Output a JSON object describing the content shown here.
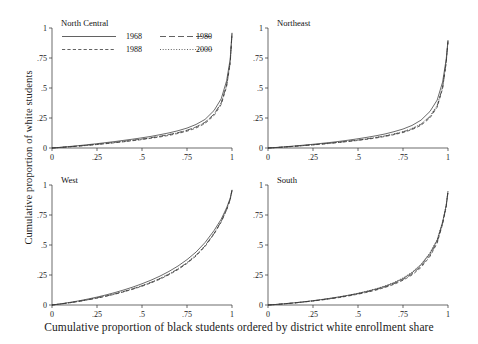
{
  "figure": {
    "xlabel": "Cumulative proportion of black students ordered by district white enrollment share",
    "ylabel": "Cumulative proportion of white students"
  },
  "chart_data": {
    "type": "line",
    "title": "",
    "xlabel": "Cumulative proportion of black students ordered by district white enrollment share",
    "ylabel": "Cumulative proportion of white students",
    "xlim": [
      0,
      1
    ],
    "ylim": [
      0,
      1
    ],
    "xticks": [
      0,
      0.25,
      0.5,
      0.75,
      1
    ],
    "xticklabels": [
      "0",
      ".25",
      ".5",
      ".75",
      "1"
    ],
    "yticks": [
      0,
      0.25,
      0.5,
      0.75,
      1
    ],
    "yticklabels": [
      "0",
      ".25",
      ".5",
      ".75",
      "1"
    ],
    "grid": false,
    "legend_position": "top-left-of-first-panel",
    "legend": [
      {
        "name": "1968",
        "dash": "none"
      },
      {
        "name": "1980",
        "dash": "long"
      },
      {
        "name": "1988",
        "dash": "short"
      },
      {
        "name": "2000",
        "dash": "dotted"
      }
    ],
    "panels": [
      {
        "name": "North Central",
        "series": [
          {
            "name": "1968",
            "dash": "none",
            "x": [
              0,
              0.05,
              0.1,
              0.15,
              0.2,
              0.25,
              0.3,
              0.35,
              0.4,
              0.45,
              0.5,
              0.55,
              0.6,
              0.65,
              0.7,
              0.75,
              0.8,
              0.85,
              0.9,
              0.94,
              0.97,
              0.99,
              1.0
            ],
            "y": [
              0,
              0.006,
              0.013,
              0.02,
              0.028,
              0.036,
              0.045,
              0.054,
              0.064,
              0.074,
              0.085,
              0.097,
              0.111,
              0.126,
              0.144,
              0.166,
              0.196,
              0.238,
              0.312,
              0.41,
              0.56,
              0.74,
              0.96
            ]
          },
          {
            "name": "1980",
            "dash": "long",
            "x": [
              0,
              0.05,
              0.1,
              0.15,
              0.2,
              0.25,
              0.3,
              0.35,
              0.4,
              0.45,
              0.5,
              0.55,
              0.6,
              0.65,
              0.7,
              0.75,
              0.8,
              0.85,
              0.9,
              0.94,
              0.97,
              0.99,
              1.0
            ],
            "y": [
              0,
              0.005,
              0.011,
              0.017,
              0.024,
              0.031,
              0.039,
              0.047,
              0.056,
              0.065,
              0.075,
              0.086,
              0.098,
              0.112,
              0.128,
              0.148,
              0.175,
              0.214,
              0.282,
              0.375,
              0.525,
              0.715,
              0.955
            ]
          },
          {
            "name": "1988",
            "dash": "short",
            "x": [
              0,
              0.05,
              0.1,
              0.15,
              0.2,
              0.25,
              0.3,
              0.35,
              0.4,
              0.45,
              0.5,
              0.55,
              0.6,
              0.65,
              0.7,
              0.75,
              0.8,
              0.85,
              0.9,
              0.94,
              0.97,
              0.99,
              1.0
            ],
            "y": [
              0,
              0.005,
              0.01,
              0.016,
              0.022,
              0.029,
              0.036,
              0.044,
              0.052,
              0.061,
              0.07,
              0.081,
              0.092,
              0.105,
              0.121,
              0.14,
              0.166,
              0.204,
              0.27,
              0.362,
              0.512,
              0.705,
              0.95
            ]
          },
          {
            "name": "2000",
            "dash": "dotted",
            "x": [
              0,
              0.05,
              0.1,
              0.15,
              0.2,
              0.25,
              0.3,
              0.35,
              0.4,
              0.45,
              0.5,
              0.55,
              0.6,
              0.65,
              0.7,
              0.75,
              0.8,
              0.85,
              0.9,
              0.94,
              0.97,
              0.99,
              1.0
            ],
            "y": [
              0,
              0.005,
              0.011,
              0.017,
              0.023,
              0.03,
              0.038,
              0.046,
              0.055,
              0.064,
              0.074,
              0.085,
              0.097,
              0.111,
              0.127,
              0.147,
              0.174,
              0.212,
              0.28,
              0.372,
              0.522,
              0.712,
              0.953
            ]
          }
        ]
      },
      {
        "name": "Northeast",
        "series": [
          {
            "name": "1968",
            "dash": "none",
            "x": [
              0,
              0.05,
              0.1,
              0.15,
              0.2,
              0.25,
              0.3,
              0.35,
              0.4,
              0.45,
              0.5,
              0.55,
              0.6,
              0.65,
              0.7,
              0.75,
              0.8,
              0.85,
              0.9,
              0.94,
              0.97,
              0.99,
              1.0
            ],
            "y": [
              0,
              0.005,
              0.011,
              0.017,
              0.024,
              0.031,
              0.039,
              0.047,
              0.056,
              0.066,
              0.077,
              0.089,
              0.102,
              0.117,
              0.136,
              0.158,
              0.188,
              0.232,
              0.305,
              0.4,
              0.55,
              0.74,
              0.9
            ]
          },
          {
            "name": "1980",
            "dash": "long",
            "x": [
              0,
              0.05,
              0.1,
              0.15,
              0.2,
              0.25,
              0.3,
              0.35,
              0.4,
              0.45,
              0.5,
              0.55,
              0.6,
              0.65,
              0.7,
              0.75,
              0.8,
              0.85,
              0.9,
              0.94,
              0.97,
              0.99,
              1.0
            ],
            "y": [
              0,
              0.004,
              0.009,
              0.015,
              0.021,
              0.027,
              0.034,
              0.041,
              0.049,
              0.057,
              0.066,
              0.076,
              0.087,
              0.1,
              0.115,
              0.134,
              0.159,
              0.196,
              0.26,
              0.35,
              0.505,
              0.715,
              0.89
            ]
          },
          {
            "name": "1988",
            "dash": "short",
            "x": [
              0,
              0.05,
              0.1,
              0.15,
              0.2,
              0.25,
              0.3,
              0.35,
              0.4,
              0.45,
              0.5,
              0.55,
              0.6,
              0.65,
              0.7,
              0.75,
              0.8,
              0.85,
              0.9,
              0.94,
              0.97,
              0.99,
              1.0
            ],
            "y": [
              0,
              0.004,
              0.009,
              0.014,
              0.02,
              0.026,
              0.032,
              0.039,
              0.047,
              0.055,
              0.063,
              0.073,
              0.083,
              0.096,
              0.111,
              0.129,
              0.153,
              0.189,
              0.251,
              0.34,
              0.496,
              0.71,
              0.885
            ]
          },
          {
            "name": "2000",
            "dash": "dotted",
            "x": [
              0,
              0.05,
              0.1,
              0.15,
              0.2,
              0.25,
              0.3,
              0.35,
              0.4,
              0.45,
              0.5,
              0.55,
              0.6,
              0.65,
              0.7,
              0.75,
              0.8,
              0.85,
              0.9,
              0.94,
              0.97,
              0.99,
              1.0
            ],
            "y": [
              0,
              0.004,
              0.009,
              0.015,
              0.021,
              0.027,
              0.034,
              0.041,
              0.049,
              0.058,
              0.067,
              0.077,
              0.089,
              0.102,
              0.118,
              0.137,
              0.163,
              0.201,
              0.266,
              0.356,
              0.51,
              0.718,
              0.892
            ]
          }
        ]
      },
      {
        "name": "West",
        "series": [
          {
            "name": "1968",
            "dash": "none",
            "x": [
              0,
              0.05,
              0.1,
              0.15,
              0.2,
              0.25,
              0.3,
              0.35,
              0.4,
              0.45,
              0.5,
              0.55,
              0.6,
              0.65,
              0.7,
              0.75,
              0.8,
              0.85,
              0.9,
              0.94,
              0.97,
              0.99,
              1.0
            ],
            "y": [
              0,
              0.01,
              0.022,
              0.035,
              0.05,
              0.066,
              0.084,
              0.104,
              0.126,
              0.15,
              0.177,
              0.207,
              0.241,
              0.28,
              0.325,
              0.378,
              0.441,
              0.52,
              0.62,
              0.715,
              0.81,
              0.89,
              0.96
            ]
          },
          {
            "name": "1980",
            "dash": "long",
            "x": [
              0,
              0.05,
              0.1,
              0.15,
              0.2,
              0.25,
              0.3,
              0.35,
              0.4,
              0.45,
              0.5,
              0.55,
              0.6,
              0.65,
              0.7,
              0.75,
              0.8,
              0.85,
              0.9,
              0.94,
              0.97,
              0.99,
              1.0
            ],
            "y": [
              0,
              0.009,
              0.019,
              0.031,
              0.044,
              0.059,
              0.075,
              0.093,
              0.113,
              0.135,
              0.16,
              0.188,
              0.22,
              0.257,
              0.3,
              0.351,
              0.413,
              0.492,
              0.595,
              0.695,
              0.795,
              0.88,
              0.955
            ]
          },
          {
            "name": "1988",
            "dash": "short",
            "x": [
              0,
              0.05,
              0.1,
              0.15,
              0.2,
              0.25,
              0.3,
              0.35,
              0.4,
              0.45,
              0.5,
              0.55,
              0.6,
              0.65,
              0.7,
              0.75,
              0.8,
              0.85,
              0.9,
              0.94,
              0.97,
              0.99,
              1.0
            ],
            "y": [
              0,
              0.009,
              0.019,
              0.03,
              0.043,
              0.057,
              0.073,
              0.09,
              0.11,
              0.132,
              0.156,
              0.184,
              0.215,
              0.252,
              0.295,
              0.346,
              0.408,
              0.487,
              0.59,
              0.691,
              0.792,
              0.878,
              0.953
            ]
          },
          {
            "name": "2000",
            "dash": "dotted",
            "x": [
              0,
              0.05,
              0.1,
              0.15,
              0.2,
              0.25,
              0.3,
              0.35,
              0.4,
              0.45,
              0.5,
              0.55,
              0.6,
              0.65,
              0.7,
              0.75,
              0.8,
              0.85,
              0.9,
              0.94,
              0.97,
              0.99,
              1.0
            ],
            "y": [
              0,
              0.009,
              0.02,
              0.031,
              0.045,
              0.06,
              0.076,
              0.094,
              0.114,
              0.137,
              0.162,
              0.19,
              0.222,
              0.259,
              0.303,
              0.354,
              0.416,
              0.495,
              0.598,
              0.698,
              0.797,
              0.882,
              0.956
            ]
          }
        ]
      },
      {
        "name": "South",
        "series": [
          {
            "name": "1968",
            "dash": "none",
            "x": [
              0,
              0.05,
              0.1,
              0.15,
              0.2,
              0.25,
              0.3,
              0.35,
              0.4,
              0.45,
              0.5,
              0.55,
              0.6,
              0.65,
              0.7,
              0.75,
              0.8,
              0.85,
              0.9,
              0.94,
              0.97,
              0.99,
              1.0
            ],
            "y": [
              0,
              0.005,
              0.012,
              0.019,
              0.027,
              0.036,
              0.046,
              0.057,
              0.069,
              0.082,
              0.097,
              0.114,
              0.133,
              0.156,
              0.184,
              0.22,
              0.268,
              0.334,
              0.43,
              0.54,
              0.69,
              0.83,
              0.95
            ]
          },
          {
            "name": "1980",
            "dash": "long",
            "x": [
              0,
              0.05,
              0.1,
              0.15,
              0.2,
              0.25,
              0.3,
              0.35,
              0.4,
              0.45,
              0.5,
              0.55,
              0.6,
              0.65,
              0.7,
              0.75,
              0.8,
              0.85,
              0.9,
              0.94,
              0.97,
              0.99,
              1.0
            ],
            "y": [
              0,
              0.005,
              0.011,
              0.018,
              0.026,
              0.034,
              0.044,
              0.054,
              0.066,
              0.079,
              0.093,
              0.109,
              0.128,
              0.15,
              0.177,
              0.212,
              0.258,
              0.322,
              0.415,
              0.525,
              0.68,
              0.822,
              0.945
            ]
          },
          {
            "name": "1988",
            "dash": "short",
            "x": [
              0,
              0.05,
              0.1,
              0.15,
              0.2,
              0.25,
              0.3,
              0.35,
              0.4,
              0.45,
              0.5,
              0.55,
              0.6,
              0.65,
              0.7,
              0.75,
              0.8,
              0.85,
              0.9,
              0.94,
              0.97,
              0.99,
              1.0
            ],
            "y": [
              0,
              0.005,
              0.011,
              0.017,
              0.025,
              0.033,
              0.042,
              0.052,
              0.063,
              0.076,
              0.09,
              0.106,
              0.124,
              0.146,
              0.172,
              0.206,
              0.25,
              0.312,
              0.405,
              0.516,
              0.674,
              0.818,
              0.943
            ]
          },
          {
            "name": "2000",
            "dash": "dotted",
            "x": [
              0,
              0.05,
              0.1,
              0.15,
              0.2,
              0.25,
              0.3,
              0.35,
              0.4,
              0.45,
              0.5,
              0.55,
              0.6,
              0.65,
              0.7,
              0.75,
              0.8,
              0.85,
              0.9,
              0.94,
              0.97,
              0.99,
              1.0
            ],
            "y": [
              0,
              0.005,
              0.011,
              0.018,
              0.026,
              0.035,
              0.045,
              0.056,
              0.068,
              0.082,
              0.097,
              0.115,
              0.135,
              0.159,
              0.188,
              0.226,
              0.274,
              0.34,
              0.436,
              0.546,
              0.694,
              0.832,
              0.948
            ]
          }
        ]
      }
    ]
  }
}
